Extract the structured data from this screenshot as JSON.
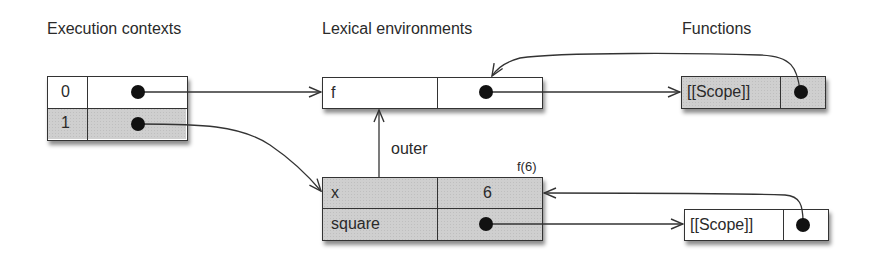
{
  "headings": {
    "execution_contexts": "Execution contexts",
    "lexical_environments": "Lexical environments",
    "functions": "Functions"
  },
  "execution_contexts": {
    "rows": [
      {
        "index": "0",
        "value": "pointer"
      },
      {
        "index": "1",
        "value": "pointer"
      }
    ]
  },
  "lexical_environments": {
    "global": {
      "rows": [
        {
          "name": "f",
          "value": "pointer"
        }
      ]
    },
    "call_f6": {
      "caption": "f(6)",
      "rows": [
        {
          "name": "x",
          "value": "6"
        },
        {
          "name": "square",
          "value": "pointer"
        }
      ]
    },
    "outer_link_label": "outer"
  },
  "functions": {
    "f": {
      "slot": "[[Scope]]",
      "value": "pointer"
    },
    "square": {
      "slot": "[[Scope]]",
      "value": "pointer"
    }
  },
  "colors": {
    "shaded_fill": "#cfcfcf",
    "line": "#333333",
    "background": "#ffffff"
  }
}
